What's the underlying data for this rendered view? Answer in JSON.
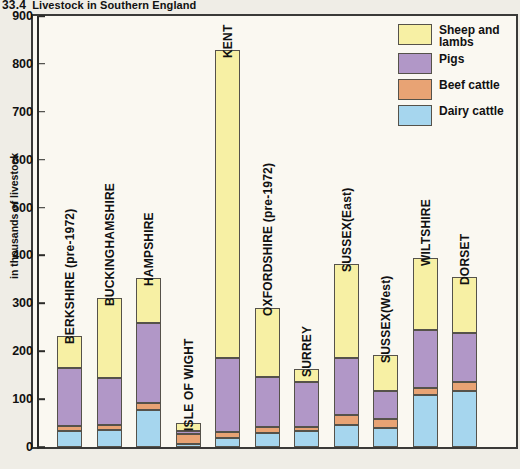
{
  "figure": {
    "number": "33.4",
    "title": "Livestock in Southern England"
  },
  "legend": {
    "position": "top-right",
    "items": [
      {
        "label_line1": "Sheep and",
        "label_line2": "lambs",
        "key": "sheep",
        "color": "#f7f0a4"
      },
      {
        "label_line1": "Pigs",
        "label_line2": "",
        "key": "pigs",
        "color": "#b197c7"
      },
      {
        "label_line1": "Beef cattle",
        "label_line2": "",
        "key": "beef",
        "color": "#e8a374"
      },
      {
        "label_line1": "Dairy cattle",
        "label_line2": "",
        "key": "dairy",
        "color": "#a6d6ee"
      }
    ]
  },
  "chart_data": {
    "type": "bar",
    "subtype": "stacked",
    "title": "Livestock in Southern England",
    "xlabel": "",
    "ylabel": "in thousands of livestock",
    "ylim": [
      0,
      900
    ],
    "ytick_step": 100,
    "yticks": [
      0,
      100,
      200,
      300,
      400,
      500,
      600,
      700,
      800,
      900
    ],
    "grid": false,
    "legend_position": "top-right",
    "categories": [
      "BERKSHIRE (pre-1972)",
      "BUCKINGHAMSHIRE",
      "HAMPSHIRE",
      "ISLE OF WIGHT",
      "KENT",
      "OXFORDSHIRE  (pre-1972)",
      "SURREY",
      "SUSSEX(East)",
      "SUSSEX(West)",
      "WILTSHIRE",
      "DORSET"
    ],
    "series": [
      {
        "name": "Dairy cattle",
        "color": "#a6d6ee",
        "values": [
          33,
          35,
          78,
          6,
          18,
          30,
          34,
          47,
          40,
          108,
          118
        ]
      },
      {
        "name": "Beef cattle",
        "color": "#e8a374",
        "values": [
          10,
          11,
          14,
          22,
          13,
          11,
          7,
          20,
          18,
          15,
          17
        ]
      },
      {
        "name": "Pigs",
        "color": "#b197c7",
        "values": [
          122,
          98,
          166,
          6,
          154,
          106,
          94,
          118,
          59,
          122,
          103
        ]
      },
      {
        "name": "Sheep and lambs",
        "color": "#f7f0a4",
        "values": [
          67,
          168,
          95,
          17,
          645,
          144,
          28,
          198,
          76,
          150,
          118
        ]
      }
    ],
    "totals": [
      232,
      312,
      353,
      51,
      830,
      291,
      163,
      383,
      193,
      395,
      356
    ]
  }
}
